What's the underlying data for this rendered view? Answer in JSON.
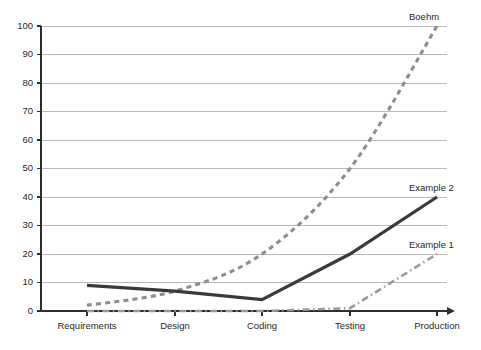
{
  "chart_data": {
    "type": "line",
    "title": "",
    "subtitle": "",
    "xlabel": "",
    "ylabel": "",
    "categories": [
      "Requirements",
      "Design",
      "Coding",
      "Testing",
      "Production"
    ],
    "ylim": [
      0,
      100
    ],
    "xlim": [
      0,
      4
    ],
    "yticks": [
      0,
      10,
      20,
      30,
      40,
      50,
      60,
      70,
      80,
      90,
      100
    ],
    "ytick_labels": [
      "0",
      "10",
      "20",
      "30",
      "40",
      "50",
      "60",
      "70",
      "80",
      "90",
      "100"
    ],
    "grid": "horizontal",
    "legend_position": "inline-right-of-line-end",
    "series": [
      {
        "name": "Boehm",
        "label": "Boehm",
        "linestyle": "dashed",
        "color": "#8d8d8d",
        "values": [
          2,
          7,
          20,
          50,
          100
        ],
        "label_value": 100
      },
      {
        "name": "Example 2",
        "label": "Example 2",
        "linestyle": "solid",
        "color": "#3a3a3a",
        "values": [
          9,
          7,
          4,
          20,
          40
        ],
        "label_value": 40
      },
      {
        "name": "Example 1",
        "label": "Example 1",
        "linestyle": "dashdot",
        "color": "#9a9a9a",
        "values": [
          0,
          0,
          0,
          1,
          20
        ],
        "label_value": 20
      }
    ],
    "annotations": [
      {
        "text": "Boehm",
        "series": "Boehm",
        "x_category": "Production",
        "y": 100
      },
      {
        "text": "Example 2",
        "series": "Example 2",
        "x_category": "Production",
        "y": 40
      },
      {
        "text": "Example 1",
        "series": "Example 1",
        "x_category": "Production",
        "y": 20
      }
    ],
    "colors": {
      "background": "#ffffff",
      "gridline": "#b9b9b9",
      "axis": "#2e2e2e",
      "boehm": "#8d8d8d",
      "example_2": "#3a3a3a",
      "example_1": "#9a9a9a"
    }
  }
}
